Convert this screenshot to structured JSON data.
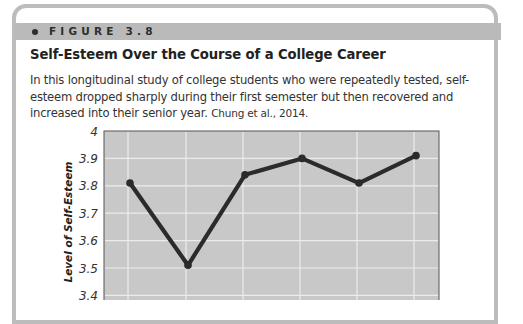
{
  "figure": {
    "label": "FIGURE 3.8",
    "title": "Self-Esteem Over the Course of a College Career",
    "caption": "In this longitudinal study of college students who were repeatedly tested, self-esteem dropped sharply during their first semester but then recovered and increased into their senior year.",
    "citation": "Chung et al., 2014."
  },
  "colors": {
    "frame": "#bcbcbc",
    "header_band": "#bababa",
    "plot_background": "#c8c8c8",
    "gridline": "#ececec",
    "line": "#2b2b2b"
  },
  "chart_data": {
    "type": "line",
    "title": "Self-Esteem Over the Course of a College Career",
    "xlabel": "",
    "ylabel": "Level of Self-Esteem",
    "x": [
      1,
      2,
      3,
      4,
      5,
      6
    ],
    "values": [
      3.81,
      3.51,
      3.84,
      3.9,
      3.81,
      3.91
    ],
    "yticks": [
      "4",
      "3.9",
      "3.8",
      "3.7",
      "3.6",
      "3.5",
      "3.4"
    ],
    "ylim": [
      3.4,
      4.0
    ],
    "grid": true,
    "legend": "none",
    "note": "x-axis tick labels cropped out of view"
  }
}
